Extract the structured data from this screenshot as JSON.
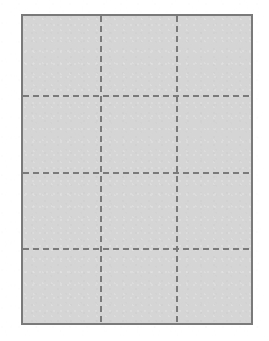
{
  "page": {
    "width": 269,
    "height": 341,
    "background_color": "#ffffff"
  },
  "panel": {
    "name": "grid-panel",
    "fill_color": "#d5d5d5",
    "border_color": "#7a7a7a",
    "border_width": 2,
    "x": 21,
    "y": 14,
    "width": 232,
    "height": 311
  },
  "grid": {
    "line_color": "#7a7a7a",
    "line_width": 2,
    "dash_pattern": "6 4",
    "columns": 3,
    "rows": 4,
    "vertical_lines": [
      {
        "label": "v1",
        "x": 78
      },
      {
        "label": "v2",
        "x": 154
      }
    ],
    "horizontal_lines": [
      {
        "label": "h1",
        "y": 80
      },
      {
        "label": "h2",
        "y": 157
      },
      {
        "label": "h3",
        "y": 233
      }
    ],
    "cells": [
      {
        "row": 1,
        "col": 1
      },
      {
        "row": 1,
        "col": 2
      },
      {
        "row": 1,
        "col": 3
      },
      {
        "row": 2,
        "col": 1
      },
      {
        "row": 2,
        "col": 2
      },
      {
        "row": 2,
        "col": 3
      },
      {
        "row": 3,
        "col": 1
      },
      {
        "row": 3,
        "col": 2
      },
      {
        "row": 3,
        "col": 3
      },
      {
        "row": 4,
        "col": 1
      },
      {
        "row": 4,
        "col": 2
      },
      {
        "row": 4,
        "col": 3
      }
    ]
  }
}
